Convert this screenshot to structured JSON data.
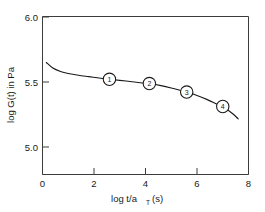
{
  "chart_data": {
    "type": "line",
    "title": "",
    "subtitle": "",
    "xlabel": "log t/a",
    "xlabel_sub": "T",
    "xlabel_unit": "(s)",
    "ylabel": "log G(t) in Pa",
    "xlim": [
      0,
      8
    ],
    "ylim": [
      4.85,
      6.0
    ],
    "grid": false,
    "legend": "none",
    "x_ticks": [
      "0",
      "2",
      "4",
      "6",
      "8"
    ],
    "x_tick_values": [
      0,
      2,
      4,
      6,
      8
    ],
    "x_minor_ticks": [
      1,
      3,
      5,
      7
    ],
    "y_ticks": [
      "5.0",
      "5.5",
      "6.0"
    ],
    "y_tick_values": [
      5.0,
      5.5,
      6.0
    ],
    "series": [
      {
        "name": "relaxation modulus",
        "x": [
          0.15,
          0.4,
          0.7,
          1.0,
          1.4,
          1.8,
          2.2,
          2.6,
          3.0,
          3.4,
          3.8,
          4.15,
          4.6,
          5.0,
          5.4,
          5.6,
          6.0,
          6.4,
          6.8,
          7.0,
          7.4,
          7.6
        ],
        "y": [
          5.665,
          5.625,
          5.6,
          5.585,
          5.572,
          5.562,
          5.552,
          5.543,
          5.535,
          5.527,
          5.518,
          5.512,
          5.497,
          5.48,
          5.46,
          5.45,
          5.425,
          5.395,
          5.36,
          5.345,
          5.29,
          5.255
        ]
      }
    ],
    "markers": [
      {
        "label": "1",
        "x": 2.6,
        "y": 5.543
      },
      {
        "label": "2",
        "x": 4.15,
        "y": 5.512
      },
      {
        "label": "3",
        "x": 5.6,
        "y": 5.45
      },
      {
        "label": "4",
        "x": 7.0,
        "y": 5.345
      }
    ],
    "colors": {
      "curve": "#1a1a1a",
      "axis": "#3c3c3c",
      "text": "#1a1a1a",
      "background": "#ffffff",
      "marker_fill": "#ffffff"
    }
  }
}
